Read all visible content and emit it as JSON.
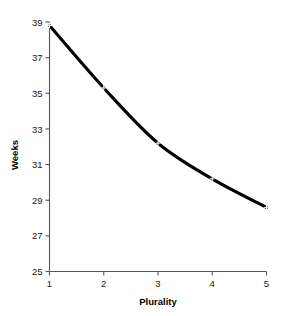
{
  "chart_data": {
    "type": "line",
    "title": "",
    "subtitle": "",
    "xlabel": "Plurality",
    "ylabel": "Weeks",
    "x": [
      1,
      2,
      3,
      4,
      5
    ],
    "values": [
      38.8,
      35.3,
      32.2,
      30.2,
      28.6
    ],
    "series": [
      {
        "name": "Weeks",
        "values": [
          38.8,
          35.3,
          32.2,
          30.2,
          28.6
        ]
      }
    ],
    "xlim": [
      1,
      5
    ],
    "ylim": [
      25,
      39
    ],
    "xticks": [
      "1",
      "2",
      "3",
      "4",
      "5"
    ],
    "yticks": [
      "25",
      "27",
      "29",
      "31",
      "33",
      "35",
      "37",
      "39"
    ],
    "xtick_values": [
      1,
      2,
      3,
      4,
      5
    ],
    "ytick_values": [
      25,
      27,
      29,
      31,
      33,
      35,
      37,
      39
    ],
    "grid": false,
    "legend": false,
    "legend_position": "none",
    "marker": "plus",
    "line_color": "#000000",
    "axis_color": "#555555",
    "background_color": "#ffffff",
    "annotations": []
  },
  "axis_titles": {
    "x": "Plurality",
    "y": "Weeks"
  }
}
